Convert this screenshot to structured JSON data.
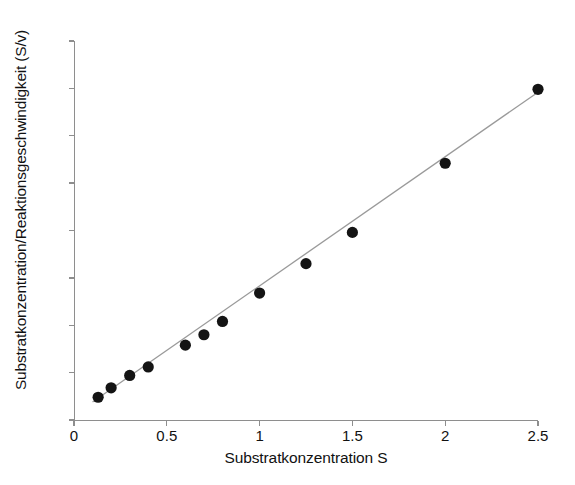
{
  "chart_data": {
    "type": "scatter",
    "title": "",
    "xlabel": "Substratkonzentration S",
    "ylabel": "Substratkonzentration/Reaktionsgeschwindigkeit (S/v)",
    "xlim": [
      0,
      2.5
    ],
    "ylim": [
      0,
      40
    ],
    "xticks": [
      0,
      0.5,
      1,
      1.5,
      2,
      2.5
    ],
    "xtick_labels": [
      "0",
      "0.5",
      "1",
      "1.5",
      "2",
      "2.5"
    ],
    "yticks": [
      0,
      5,
      10,
      15,
      20,
      25,
      30,
      35,
      40
    ],
    "ytick_labels": [
      "0",
      "5",
      "10",
      "15",
      "20",
      "25",
      "30",
      "35",
      "40"
    ],
    "grid": false,
    "legend": false,
    "marker": "filled-circle",
    "marker_color": "#141414",
    "line_color": "#9a9a9a",
    "background_color": "#ffffff",
    "axis_color": "#8e8e8e",
    "x": [
      0.13,
      0.2,
      0.3,
      0.4,
      0.6,
      0.7,
      0.8,
      1.0,
      1.25,
      1.5,
      2.0,
      2.5
    ],
    "y": [
      2.4,
      3.4,
      4.7,
      5.6,
      7.9,
      9.0,
      10.4,
      13.4,
      16.5,
      19.8,
      27.1,
      34.9
    ],
    "series": [
      {
        "name": "Messpunkte",
        "points": [
          {
            "x": 0.13,
            "y": 2.4
          },
          {
            "x": 0.2,
            "y": 3.4
          },
          {
            "x": 0.3,
            "y": 4.7
          },
          {
            "x": 0.4,
            "y": 5.6
          },
          {
            "x": 0.6,
            "y": 7.9
          },
          {
            "x": 0.7,
            "y": 9.0
          },
          {
            "x": 0.8,
            "y": 10.4
          },
          {
            "x": 1.0,
            "y": 13.4
          },
          {
            "x": 1.25,
            "y": 16.5
          },
          {
            "x": 1.5,
            "y": 19.8
          },
          {
            "x": 2.0,
            "y": 27.1
          },
          {
            "x": 2.5,
            "y": 34.9
          }
        ]
      },
      {
        "name": "Regressionsgerade",
        "type": "line",
        "endpoints": [
          {
            "x": 0.1,
            "y": 1.9
          },
          {
            "x": 2.5,
            "y": 34.6
          }
        ]
      }
    ]
  }
}
